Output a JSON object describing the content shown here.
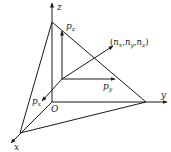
{
  "diagram": {
    "type": "3d-coordinate-plane-with-normal",
    "colors": {
      "stroke": "#1a1a1a",
      "background": "#ffffff"
    },
    "axes": {
      "z": {
        "label": "z"
      },
      "y": {
        "label": "y"
      },
      "x": {
        "label": "x"
      },
      "origin": {
        "label": "O"
      }
    },
    "components": {
      "pz": {
        "base": "p",
        "sub": "z"
      },
      "py": {
        "base": "p",
        "sub": "y"
      },
      "px": {
        "base": "p",
        "sub": "x"
      }
    },
    "normal": {
      "open": "(",
      "n1": "n",
      "s1": "x",
      "comma1": ",",
      "n2": "n",
      "s2": "y",
      "comma2": ",",
      "n3": "n",
      "s3": "z",
      "close": ")"
    }
  }
}
